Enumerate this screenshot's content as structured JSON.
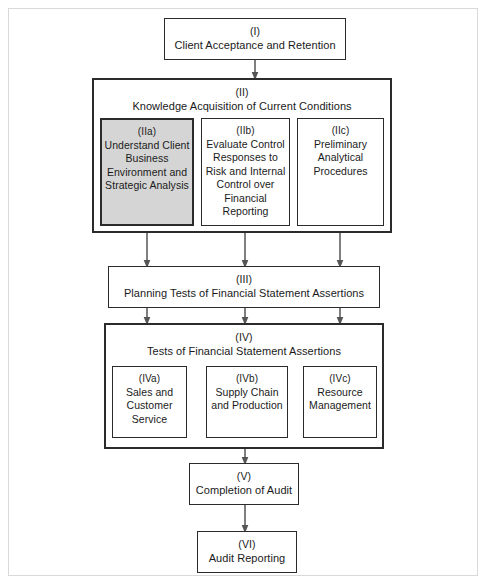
{
  "diagram": {
    "colors": {
      "frame": "#d9d9d9",
      "box_border": "#2b2b2b",
      "shaded_fill": "#d5d5d5",
      "arrow": "#555555",
      "text": "#1a1a1a",
      "background": "#ffffff"
    }
  },
  "nodes": {
    "i": {
      "roman": "(I)",
      "caption": "Client Acceptance and Retention"
    },
    "ii": {
      "roman": "(II)",
      "caption": "Knowledge Acquisition of Current Conditions"
    },
    "iia": {
      "roman": "(IIa)",
      "caption": "Understand Client Business Environment and Strategic Analysis",
      "shaded": true
    },
    "iib": {
      "roman": "(IIb)",
      "caption": "Evaluate Control Responses to Risk and Internal Control over Financial Reporting",
      "shaded": false
    },
    "iic": {
      "roman": "(IIc)",
      "caption": "Preliminary Analytical Procedures",
      "shaded": false
    },
    "iii": {
      "roman": "(III)",
      "caption": "Planning Tests of Financial Statement Assertions"
    },
    "iv": {
      "roman": "(IV)",
      "caption": "Tests of Financial Statement Assertions"
    },
    "iva": {
      "roman": "(IVa)",
      "caption": "Sales and Customer Service"
    },
    "ivb": {
      "roman": "(IVb)",
      "caption": "Supply Chain and Production"
    },
    "ivc": {
      "roman": "(IVc)",
      "caption": "Resource Management"
    },
    "v": {
      "roman": "(V)",
      "caption": "Completion of Audit"
    },
    "vi": {
      "roman": "(VI)",
      "caption": "Audit Reporting"
    }
  },
  "edges": [
    {
      "from": "i",
      "to": "ii"
    },
    {
      "from": "iia",
      "to": "iii"
    },
    {
      "from": "iib",
      "to": "iii"
    },
    {
      "from": "iic",
      "to": "iii"
    },
    {
      "from": "iii",
      "to": "iv-left"
    },
    {
      "from": "iii",
      "to": "iv-center"
    },
    {
      "from": "iii",
      "to": "iv-right"
    },
    {
      "from": "iv",
      "to": "v"
    },
    {
      "from": "v",
      "to": "vi"
    }
  ]
}
